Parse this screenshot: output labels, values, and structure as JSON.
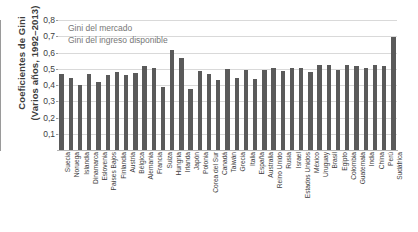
{
  "chart_data": {
    "type": "bar",
    "title": "",
    "ylabel": "Coeficientes de Gini\n(Varios años, 1992–2013)",
    "xlabel": "",
    "ylim": [
      0,
      0.8
    ],
    "grid": true,
    "y_ticks": [
      "0,8",
      "0,7",
      "0,6",
      "0,5",
      "0,4",
      "0,3",
      "0,2",
      "0,1"
    ],
    "y_tick_values": [
      0.8,
      0.7,
      0.6,
      0.5,
      0.4,
      0.3,
      0.2,
      0.1
    ],
    "legend_position": "top-left",
    "legend": [
      "Gini del mercado",
      "Gini del ingreso disponible"
    ],
    "series_color": "#5a5a5a",
    "categories": [
      "Suecia",
      "Noruega",
      "Islandia",
      "Dinamarca",
      "Eslovenia",
      "Países Bajos",
      "Finlandia",
      "Austria",
      "Bélgica",
      "Alemania",
      "Francia",
      "Suiza",
      "Hungría",
      "Irlanda",
      "Japón",
      "Polonia",
      "Corea del Sur",
      "Canadá",
      "Taiwán",
      "Grecia",
      "Italia",
      "España",
      "Australia",
      "Reino Unido",
      "Rusia",
      "Israel",
      "Estados Unidos",
      "México",
      "Uruguay",
      "Brasil",
      "Egipto",
      "Colombia",
      "Guatemala",
      "India",
      "China",
      "Perú",
      "Sudáfrica"
    ],
    "values": [
      0.47,
      0.445,
      0.402,
      0.47,
      0.417,
      0.46,
      0.481,
      0.461,
      0.476,
      0.519,
      0.503,
      0.39,
      0.613,
      0.569,
      0.377,
      0.486,
      0.47,
      0.432,
      0.497,
      0.443,
      0.49,
      0.44,
      0.491,
      0.505,
      0.485,
      0.505,
      0.506,
      0.483,
      0.521,
      0.521,
      0.495,
      0.523,
      0.518,
      0.503,
      0.522,
      0.515,
      0.695
    ]
  }
}
